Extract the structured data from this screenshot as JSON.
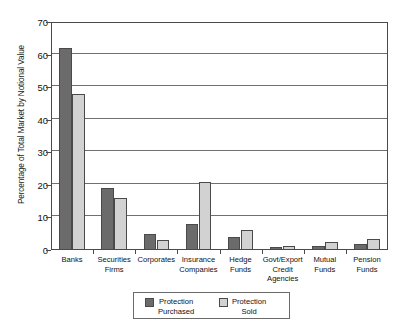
{
  "chart_data": {
    "type": "bar",
    "title": "",
    "subtitle": "",
    "xlabel": "",
    "ylabel": "Percentage of Total Market by Notional Value",
    "ylim": [
      0,
      70
    ],
    "yticks": [
      0,
      10,
      20,
      30,
      40,
      50,
      60,
      70
    ],
    "ytick_labels": [
      "0",
      "10",
      "20",
      "30",
      "40",
      "50",
      "60",
      "70"
    ],
    "grid": true,
    "grid_axis": "y",
    "legend_position": "bottom-center",
    "categories": [
      "Banks",
      "Securities Firms",
      "Corporates",
      "Insurance Companies",
      "Hedge Funds",
      "Govt/Export Credit Agencies",
      "Mutual Funds",
      "Pension Funds"
    ],
    "category_lines": [
      [
        "Banks"
      ],
      [
        "Securities",
        "Firms"
      ],
      [
        "Corporates"
      ],
      [
        "Insurance",
        "Companies"
      ],
      [
        "Hedge",
        "Funds"
      ],
      [
        "Govt/Export",
        "Credit",
        "Agencies"
      ],
      [
        "Mutual",
        "Funds"
      ],
      [
        "Pension",
        "Funds"
      ]
    ],
    "series": [
      {
        "name": "Protection Purchased",
        "name_lines": [
          "Protection",
          "Purchased"
        ],
        "color": "#6b6b6b",
        "values": [
          62,
          19,
          4.8,
          8,
          4,
          1,
          1.2,
          2
        ]
      },
      {
        "name": "Protection Sold",
        "name_lines": [
          "Protection",
          "Sold"
        ],
        "color": "#d2d2d2",
        "values": [
          48,
          16,
          3,
          21,
          6,
          1.2,
          2.5,
          3.5
        ]
      }
    ]
  },
  "style": {
    "axis_color": "#4a4a4a",
    "grid_color": "#707070",
    "text_color": "#111111",
    "background": "#ffffff"
  }
}
